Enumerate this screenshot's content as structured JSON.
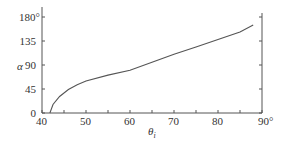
{
  "chart_data": {
    "type": "line",
    "title": "",
    "xlabel": "θ_i",
    "ylabel": "α",
    "xlim": [
      40,
      90
    ],
    "ylim": [
      0,
      180
    ],
    "x_ticks": [
      "40",
      "50",
      "60",
      "70",
      "80",
      "90°"
    ],
    "y_ticks": [
      "0",
      "45",
      "90",
      "135",
      "180°"
    ],
    "grid": false,
    "legend": null,
    "series": [
      {
        "name": "α vs θ_i",
        "x": [
          41.8,
          42.5,
          44,
          46,
          48,
          50,
          55,
          60,
          65,
          70,
          75,
          80,
          85,
          88
        ],
        "y": [
          0,
          16,
          31,
          44,
          53,
          60,
          71,
          80,
          95,
          110,
          124,
          138,
          152,
          165
        ]
      }
    ],
    "colors": {
      "line": "#555555",
      "axis": "#555555",
      "text": "#333333"
    }
  }
}
